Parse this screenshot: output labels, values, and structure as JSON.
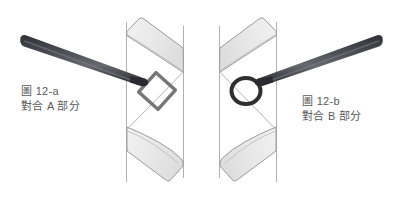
{
  "figure": {
    "background_color": "#ffffff",
    "width": 403,
    "height": 198
  },
  "panels": [
    {
      "id": "panel-a",
      "caption_line1": "圖 12-a",
      "caption_line2": "對合 A 部分",
      "marker_shape_name": "diamond-marker",
      "marker_color": "#6b6b6b",
      "tool_name": "pencil-tool",
      "tool_color_dark": "#33333a",
      "tool_color_light": "#6e6e76",
      "ribbon_name": "twisted-ribbon",
      "ribbon_fill": "#eeeeee",
      "ribbon_stroke": "#9a9a9a"
    },
    {
      "id": "panel-b",
      "caption_line1": "圖 12-b",
      "caption_line2": "對合 B 部分",
      "marker_shape_name": "circle-marker",
      "marker_color": "#3a3a3a",
      "tool_name": "pencil-tool",
      "tool_color_dark": "#33333a",
      "tool_color_light": "#6e6e76",
      "ribbon_name": "twisted-ribbon",
      "ribbon_fill": "#eeeeee",
      "ribbon_stroke": "#9a9a9a"
    }
  ]
}
